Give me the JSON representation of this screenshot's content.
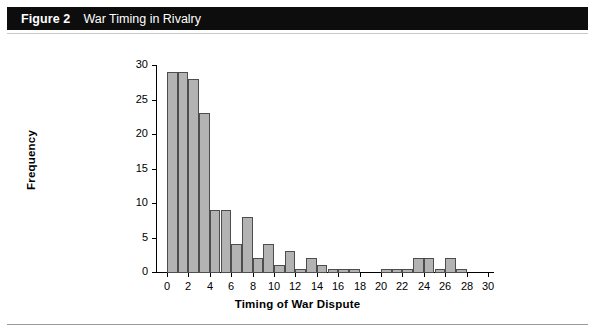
{
  "figure": {
    "label": "Figure 2",
    "title": "War Timing in Rivalry"
  },
  "chart_data": {
    "type": "bar",
    "title": "War Timing in Rivalry",
    "xlabel": "Timing of War Dispute",
    "ylabel": "Frequency",
    "xlim": [
      0,
      30
    ],
    "ylim": [
      0,
      30
    ],
    "xticks": [
      0,
      2,
      4,
      6,
      8,
      10,
      12,
      14,
      16,
      18,
      20,
      22,
      24,
      26,
      28,
      30
    ],
    "yticks": [
      0,
      5,
      10,
      15,
      20,
      25,
      30
    ],
    "grid": false,
    "legend": null,
    "bin_width": 1,
    "categories": [
      "0-1",
      "1-2",
      "2-3",
      "3-4",
      "4-5",
      "5-6",
      "6-7",
      "7-8",
      "8-9",
      "9-10",
      "10-11",
      "11-12",
      "12-13",
      "13-14",
      "14-15",
      "15-16",
      "16-17",
      "17-18",
      "18-19",
      "19-20",
      "20-21",
      "21-22",
      "22-23",
      "23-24",
      "24-25",
      "25-26",
      "26-27",
      "27-28",
      "28-29",
      "29-30"
    ],
    "bin_starts": [
      0,
      1,
      2,
      3,
      4,
      5,
      6,
      7,
      8,
      9,
      10,
      11,
      12,
      13,
      14,
      15,
      16,
      17,
      18,
      19,
      20,
      21,
      22,
      23,
      24,
      25,
      26,
      27,
      28,
      29
    ],
    "values": [
      29,
      29,
      28,
      23,
      9,
      9,
      4,
      8,
      2,
      4,
      1,
      3,
      0.5,
      2,
      1,
      0.5,
      0.5,
      0.5,
      0,
      0,
      0.5,
      0.5,
      0.5,
      2,
      2,
      0.5,
      2,
      0.5,
      0,
      0
    ]
  },
  "axis": {
    "y_title": "Frequency",
    "x_title": "Timing of War Dispute"
  }
}
